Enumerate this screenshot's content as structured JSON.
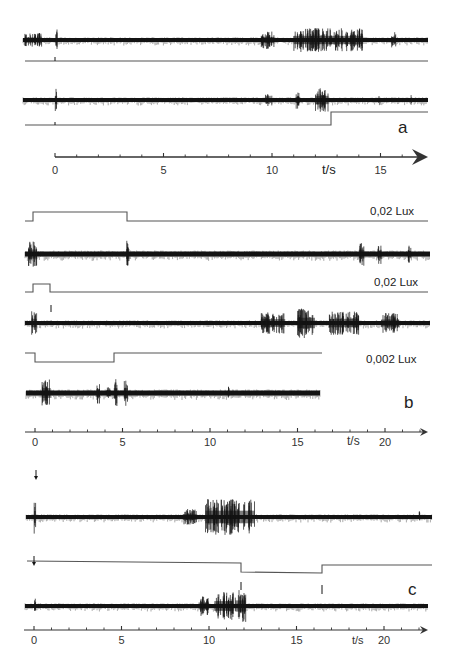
{
  "chart_data": [
    {
      "type": "line",
      "panel": "a",
      "title": "",
      "xlabel": "t/s",
      "ylabel": "",
      "x_ticks": [
        0,
        5,
        10,
        15
      ],
      "x_range": [
        0,
        17
      ],
      "grid": false,
      "series": [
        {
          "name": "recording 1 (spikes)",
          "kind": "spike_trace",
          "bursts_s": [
            [
              -1.2,
              -0.8
            ],
            [
              0,
              0.1
            ],
            [
              9.5,
              10.1
            ],
            [
              11.0,
              14.2
            ],
            [
              15.5,
              15.7
            ]
          ]
        },
        {
          "name": "stimulus 1",
          "kind": "step",
          "note": "flat baseline with marker at 0 s"
        },
        {
          "name": "recording 2 (spikes)",
          "kind": "spike_trace",
          "bursts_s": [
            [
              0,
              0.1
            ],
            [
              9.7,
              10.0
            ],
            [
              11.1,
              11.3
            ],
            [
              12.0,
              12.6
            ],
            [
              14.9,
              15.0
            ],
            [
              16.4,
              16.5
            ]
          ]
        },
        {
          "name": "stimulus 2",
          "kind": "step",
          "step_up_at_s": 12.7
        }
      ]
    },
    {
      "type": "line",
      "panel": "b",
      "xlabel": "t/s",
      "x_ticks": [
        0,
        5,
        10,
        15,
        20
      ],
      "x_range": [
        0,
        22.5
      ],
      "grid": false,
      "series": [
        {
          "name": "stimulus 0,02 Lux (long pulse)",
          "kind": "pulse_up",
          "on_s": 0,
          "off_s": 5.3,
          "label": "0,02 Lux"
        },
        {
          "name": "recording (spikes)",
          "kind": "spike_trace",
          "bursts_s": [
            [
              -0.2,
              0.2
            ],
            [
              5.2,
              5.4
            ],
            [
              18.6,
              18.8
            ],
            [
              19.6,
              19.8
            ],
            [
              21.3,
              21.5
            ]
          ]
        },
        {
          "name": "stimulus 0,02 Lux (short pulse)",
          "kind": "pulse_up",
          "on_s": 0,
          "off_s": 0.9,
          "label": "0,02 Lux"
        },
        {
          "name": "recording (spikes)",
          "kind": "spike_trace",
          "bursts_s": [
            [
              -0.1,
              0.1
            ],
            [
              12.9,
              14.2
            ],
            [
              15.0,
              16.0
            ],
            [
              16.8,
              18.5
            ],
            [
              19.8,
              20.8
            ]
          ]
        },
        {
          "name": "stimulus 0,002 Lux (dimming)",
          "kind": "pulse_down",
          "on_s": 0,
          "off_s": 4.5,
          "label": "0,002 Lux"
        },
        {
          "name": "recording (spikes)",
          "kind": "spike_trace",
          "bursts_s": [
            [
              0.5,
              0.9
            ],
            [
              3.5,
              3.7
            ],
            [
              4.1,
              4.3
            ],
            [
              4.5,
              4.7
            ],
            [
              5.1,
              5.3
            ],
            [
              11.0,
              11.1
            ]
          ]
        }
      ]
    },
    {
      "type": "line",
      "panel": "c",
      "xlabel": "t/s",
      "x_ticks": [
        0,
        5,
        10,
        15,
        20
      ],
      "x_range": [
        0,
        22.5
      ],
      "grid": false,
      "series": [
        {
          "name": "recording 1 (spikes)",
          "kind": "spike_trace",
          "stimulus_marker_s": 0,
          "bursts_s": [
            [
              0,
              0.1
            ],
            [
              8.5,
              9.3
            ],
            [
              9.8,
              12.5
            ],
            [
              22.0,
              22.1
            ]
          ]
        },
        {
          "name": "stimulus",
          "kind": "pulse_down",
          "on_s": 11.9,
          "off_s": 16.5,
          "stimulus_marker_s": 0
        },
        {
          "name": "recording 2 (spikes)",
          "kind": "spike_trace",
          "bursts_s": [
            [
              0,
              0.1
            ],
            [
              9.4,
              10.0
            ],
            [
              10.3,
              11.4
            ],
            [
              11.5,
              12.1
            ]
          ]
        }
      ]
    }
  ],
  "panels": {
    "a": {
      "label": "a",
      "axis": {
        "unit": "t/s",
        "ticks": [
          "0",
          "5",
          "10",
          "15"
        ],
        "x0": 55,
        "px_per_s": 21.7,
        "y": 157,
        "end": 428,
        "minor_per_major": 5
      },
      "traces": [
        {
          "type": "spikes",
          "y": 40,
          "x1": 23,
          "x2": 428,
          "thick": 4,
          "seed": 11,
          "bursts": [
            [
              -1.4,
              -0.6,
              7
            ],
            [
              0,
              0.1,
              16
            ],
            [
              9.5,
              10.1,
              9
            ],
            [
              11.0,
              14.2,
              12
            ],
            [
              15.5,
              15.7,
              8
            ]
          ]
        },
        {
          "type": "line",
          "points": [
            [
              25,
              61
            ],
            [
              428,
              61
            ]
          ],
          "marks": [
            [
              55,
              57,
              61
            ]
          ]
        },
        {
          "type": "spikes",
          "y": 100,
          "x1": 23,
          "x2": 428,
          "thick": 4,
          "seed": 23,
          "bursts": [
            [
              0,
              0.1,
              12
            ],
            [
              9.7,
              10.0,
              6
            ],
            [
              11.1,
              11.3,
              9
            ],
            [
              12.0,
              12.6,
              12
            ],
            [
              14.9,
              15.0,
              5
            ],
            [
              16.4,
              16.5,
              6
            ]
          ]
        },
        {
          "type": "line",
          "points": [
            [
              25,
              125
            ],
            [
              331,
              125
            ],
            [
              331,
              112
            ],
            [
              428,
              112
            ]
          ],
          "marks": [
            [
              55,
              122,
              125
            ]
          ]
        }
      ]
    },
    "b": {
      "label": "b",
      "axis": {
        "unit": "t/s",
        "ticks": [
          "0",
          "5",
          "10",
          "15",
          "20"
        ],
        "x0": 35,
        "px_per_s": 17.5,
        "y": 432,
        "end": 428,
        "minor_per_major": 5
      },
      "lux_labels": [
        "0,02 Lux",
        "0,02 Lux",
        "0,002 Lux"
      ],
      "traces": [
        {
          "type": "line",
          "points": [
            [
              25,
              221
            ],
            [
              33,
              221
            ],
            [
              33,
              212
            ],
            [
              127,
              212
            ],
            [
              127,
              221
            ],
            [
              428,
              221
            ]
          ]
        },
        {
          "type": "spikes",
          "y": 254,
          "x1": 25,
          "x2": 430,
          "thick": 5,
          "seed": 37,
          "bursts": [
            [
              -0.4,
              0.1,
              13
            ],
            [
              5.2,
              5.4,
              14
            ],
            [
              18.5,
              18.8,
              12
            ],
            [
              19.6,
              19.8,
              10
            ],
            [
              21.3,
              21.5,
              9
            ]
          ]
        },
        {
          "type": "line",
          "points": [
            [
              25,
              292
            ],
            [
              33,
              292
            ],
            [
              33,
              284
            ],
            [
              50,
              284
            ],
            [
              50,
              292
            ],
            [
              428,
              292
            ]
          ],
          "marks": [
            [
              51,
              305,
              312
            ]
          ]
        },
        {
          "type": "spikes",
          "y": 323,
          "x1": 25,
          "x2": 430,
          "thick": 4,
          "seed": 51,
          "bursts": [
            [
              -0.2,
              0.1,
              12
            ],
            [
              12.9,
              14.3,
              11
            ],
            [
              15.0,
              16.0,
              15
            ],
            [
              16.8,
              18.5,
              12
            ],
            [
              19.8,
              20.8,
              10
            ]
          ]
        },
        {
          "type": "line",
          "points": [
            [
              25,
              353
            ],
            [
              35,
              353
            ],
            [
              35,
              362
            ],
            [
              114,
              362
            ],
            [
              114,
              353
            ],
            [
              322,
              353
            ]
          ]
        },
        {
          "type": "spikes",
          "y": 393,
          "x1": 26,
          "x2": 320,
          "thick": 5,
          "seed": 67,
          "bursts": [
            [
              0.4,
              0.9,
              14
            ],
            [
              3.5,
              3.7,
              11
            ],
            [
              4.1,
              4.3,
              8
            ],
            [
              4.5,
              4.7,
              14
            ],
            [
              5.1,
              5.3,
              14
            ],
            [
              11.0,
              11.1,
              7
            ]
          ]
        }
      ]
    },
    "c": {
      "label": "c",
      "axis": {
        "unit": "t/s",
        "ticks": [
          "0",
          "5",
          "10",
          "15",
          "20"
        ],
        "x0": 34,
        "px_per_s": 17.5,
        "y": 630,
        "end": 428,
        "minor_per_major": 5
      },
      "stimulus_arrows": [
        {
          "x": 36,
          "y": 476
        },
        {
          "x": 34,
          "y": 562
        }
      ],
      "traces": [
        {
          "type": "spikes",
          "y": 517,
          "x1": 26,
          "x2": 432,
          "thick": 4,
          "seed": 79,
          "bursts": [
            [
              0,
              0.1,
              17
            ],
            [
              8.5,
              9.3,
              8
            ],
            [
              9.8,
              12.6,
              18
            ],
            [
              22.0,
              22.1,
              6
            ]
          ]
        },
        {
          "type": "line",
          "points": [
            [
              27,
              561
            ],
            [
              241,
              563
            ],
            [
              241,
              572
            ],
            [
              322,
              573
            ],
            [
              322,
              565
            ],
            [
              432,
              565
            ]
          ],
          "marks": [
            [
              241,
              582,
              590
            ],
            [
              322,
              585,
              594
            ]
          ]
        },
        {
          "type": "spikes",
          "y": 606,
          "x1": 25,
          "x2": 428,
          "thick": 4,
          "seed": 97,
          "bursts": [
            [
              0,
              0.1,
              9
            ],
            [
              9.4,
              10.0,
              10
            ],
            [
              10.3,
              11.4,
              14
            ],
            [
              11.5,
              12.1,
              16
            ]
          ]
        }
      ]
    }
  },
  "labels": {
    "panel_a": "a",
    "panel_b": "b",
    "panel_c": "c",
    "lux_1": "0,02 Lux",
    "lux_2": "0,02 Lux",
    "lux_3": "0,002 Lux",
    "axis_unit_a": "t/s",
    "axis_unit_b": "t/s",
    "axis_unit_c": "t/s",
    "ticks_a": [
      "0",
      "5",
      "10",
      "15"
    ],
    "ticks_b": [
      "0",
      "5",
      "10",
      "15",
      "20"
    ],
    "ticks_c": [
      "0",
      "5",
      "10",
      "15",
      "20"
    ]
  },
  "colors": {
    "ink": "#141414",
    "stim": "#555555",
    "axis": "#333333",
    "background": "#ffffff"
  }
}
